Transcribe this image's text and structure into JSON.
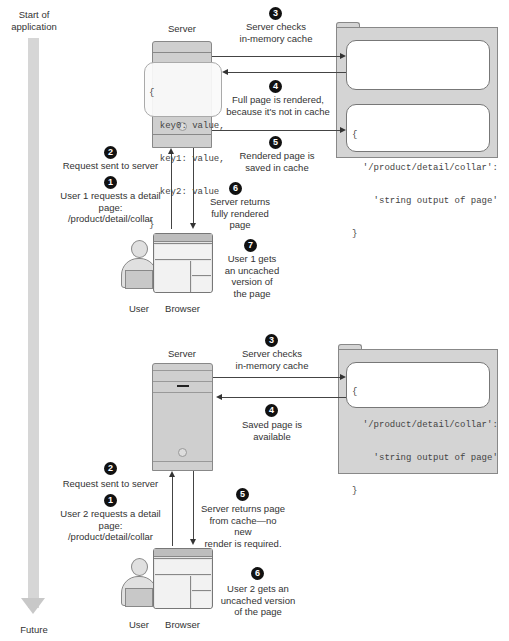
{
  "timeline": {
    "start_label": "Start of application",
    "end_label": "Future"
  },
  "scenario1": {
    "server_label": "Server",
    "server_cache_code": [
      "{",
      "  key0: value,",
      "  key1: value,",
      "  key2: value",
      "}"
    ],
    "cache_entry_code": [
      "{",
      "  '/product/detail/collar':",
      "    'string output of page'",
      "}"
    ],
    "user_label": "User",
    "browser_label": "Browser",
    "steps": [
      {
        "num": "1",
        "text": "User 1 requests a detail page:\n/product/detail/collar"
      },
      {
        "num": "2",
        "text": "Request sent to server"
      },
      {
        "num": "3",
        "text": "Server checks\nin-memory cache"
      },
      {
        "num": "4",
        "text": "Full page is rendered,\nbecause it's not in cache"
      },
      {
        "num": "5",
        "text": "Rendered page is\nsaved in cache"
      },
      {
        "num": "6",
        "text": "Server returns\nfully rendered page"
      },
      {
        "num": "7",
        "text": "User 1 gets\nan uncached\nversion of\nthe page"
      }
    ]
  },
  "scenario2": {
    "server_label": "Server",
    "cache_entry_code": [
      "{",
      "  '/product/detail/collar':",
      "    'string output of page'",
      "}"
    ],
    "user_label": "User",
    "browser_label": "Browser",
    "steps": [
      {
        "num": "1",
        "text": "User 2 requests a detail page:\n/product/detail/collar"
      },
      {
        "num": "2",
        "text": "Request sent to server"
      },
      {
        "num": "3",
        "text": "Server checks\nin-memory cache"
      },
      {
        "num": "4",
        "text": "Saved page is available"
      },
      {
        "num": "5",
        "text": "Server returns page\nfrom cache—no new\nrender is required."
      },
      {
        "num": "6",
        "text": "User 2 gets an\nuncached version\nof the page"
      }
    ]
  }
}
